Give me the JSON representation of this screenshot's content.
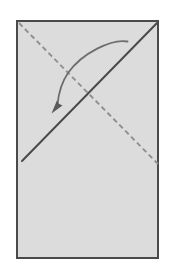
{
  "diagram": {
    "title": "Origami fold step diagram",
    "type": "paper-folding-instruction",
    "canvas": {
      "width": 175,
      "height": 277,
      "background": "#ffffff"
    },
    "paper": {
      "label": "Paper sheet",
      "shape": "rectangle",
      "x": 17,
      "y": 21,
      "width": 141,
      "height": 237,
      "fill": "#dcdcdc",
      "stroke": "#4a4a4a",
      "stroke_width": 2.4
    },
    "fold_line": {
      "label": "Valley fold line",
      "style": "dashed",
      "dash_pattern": "5 3.4",
      "stroke": "#8f8f8f",
      "stroke_width": 1.9,
      "x1": 19,
      "y1": 23,
      "x2": 158,
      "y2": 164
    },
    "crease_line": {
      "label": "Existing crease edge",
      "style": "solid",
      "stroke": "#4a4a4a",
      "stroke_width": 2.0,
      "x1": 22,
      "y1": 161,
      "x2": 157,
      "y2": 23
    },
    "motion_arrow": {
      "label": "Fold direction arrow",
      "style": "curved",
      "stroke": "#6e6e6e",
      "stroke_width": 1.8,
      "path": "M 127.5 41.5 C 112 38.5 82 53 68 73 C 62.5 81 58.5 94 57.5 104.5",
      "arrowhead": {
        "label": "Arrowhead",
        "points": "51.5,113.5 62.5,105.5 58.8,103.8 57.0,100.2",
        "fill": "#5a5a5a"
      }
    }
  }
}
